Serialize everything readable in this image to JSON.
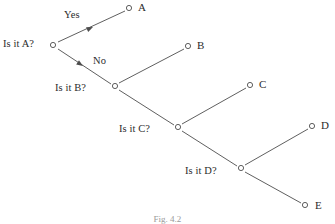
{
  "figure": {
    "caption": "Fig. 4.2",
    "stroke_color": "#4d4d4d",
    "node_fill": "#ffffff",
    "text_color": "#2b2b2b"
  },
  "diagram": {
    "type": "decision-tree",
    "questions": [
      {
        "id": "q_a",
        "label": "Is it A?",
        "x": 53,
        "y": 45,
        "text_x": 3,
        "text_y": 39
      },
      {
        "id": "q_b",
        "label": "Is it B?",
        "x": 115,
        "y": 86,
        "text_x": 55,
        "text_y": 83
      },
      {
        "id": "q_c",
        "label": "Is it C?",
        "x": 178,
        "y": 127,
        "text_x": 119,
        "text_y": 124
      },
      {
        "id": "q_d",
        "label": "Is it D?",
        "x": 241,
        "y": 168,
        "text_x": 185,
        "text_y": 166
      }
    ],
    "leaves": [
      {
        "id": "leaf_a",
        "label": "A",
        "x": 129,
        "y": 8,
        "text_x": 138,
        "text_y": 2
      },
      {
        "id": "leaf_b",
        "label": "B",
        "x": 188,
        "y": 46,
        "text_x": 197,
        "text_y": 40
      },
      {
        "id": "leaf_c",
        "label": "C",
        "x": 250,
        "y": 85,
        "text_x": 259,
        "text_y": 79
      },
      {
        "id": "leaf_d",
        "label": "D",
        "x": 312,
        "y": 126,
        "text_x": 321,
        "text_y": 120
      },
      {
        "id": "leaf_e",
        "label": "E",
        "x": 305,
        "y": 205,
        "text_x": 315,
        "text_y": 200
      }
    ],
    "edges": [
      {
        "id": "edge_a_yes",
        "from": "q_a",
        "to": "leaf_a",
        "branch": "Yes",
        "x1": 58,
        "y1": 42,
        "x2": 125,
        "y2": 11,
        "arrow_x": 93,
        "arrow_y": 27,
        "label_x": 64,
        "label_y": 10
      },
      {
        "id": "edge_a_no",
        "from": "q_a",
        "to": "q_b",
        "branch": "No",
        "x1": 58,
        "y1": 49,
        "x2": 111,
        "y2": 84,
        "arrow_x": 83,
        "arrow_y": 66,
        "label_x": 93,
        "label_y": 56
      },
      {
        "id": "edge_b_yes",
        "from": "q_b",
        "to": "leaf_b",
        "branch": "",
        "x1": 119,
        "y1": 83,
        "x2": 184,
        "y2": 49
      },
      {
        "id": "edge_b_no",
        "from": "q_b",
        "to": "q_c",
        "branch": "",
        "x1": 119,
        "y1": 90,
        "x2": 174,
        "y2": 125
      },
      {
        "id": "edge_c_yes",
        "from": "q_c",
        "to": "leaf_c",
        "branch": "",
        "x1": 182,
        "y1": 124,
        "x2": 246,
        "y2": 88
      },
      {
        "id": "edge_c_no",
        "from": "q_c",
        "to": "q_d",
        "branch": "",
        "x1": 182,
        "y1": 131,
        "x2": 237,
        "y2": 166
      },
      {
        "id": "edge_d_yes",
        "from": "q_d",
        "to": "leaf_d",
        "branch": "",
        "x1": 245,
        "y1": 165,
        "x2": 308,
        "y2": 129
      },
      {
        "id": "edge_d_no",
        "from": "q_d",
        "to": "leaf_e",
        "branch": "",
        "x1": 245,
        "y1": 172,
        "x2": 301,
        "y2": 203
      }
    ]
  }
}
